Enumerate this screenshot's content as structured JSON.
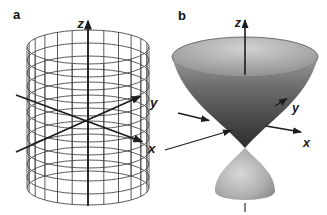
{
  "figure": {
    "panels": {
      "a": {
        "label": "a",
        "axes": {
          "x": "x",
          "y": "y",
          "z": "z"
        }
      },
      "b": {
        "label": "b",
        "axes": {
          "x": "x",
          "y": "y",
          "z": "z"
        }
      }
    },
    "colors": {
      "background": "#ffffff",
      "panel_label": "#111111",
      "axis": "#1c1c1c",
      "wireframe": "#4a4a4a",
      "rim_stroke": "#6f6f6f",
      "bowl_top": "#9a9a9a",
      "bowl_mid": "#6e6e6e",
      "bowl_low": "#464646",
      "bowl_apex": "#2e2e2e",
      "interior_highlight": "#d2d2d2",
      "interior_mid": "#a8a8a8",
      "interior_edge": "#828282",
      "cone_highlight": "#d8d8d8",
      "cone_mid": "#aeaeae",
      "cone_edge": "#7f7f7f"
    }
  }
}
